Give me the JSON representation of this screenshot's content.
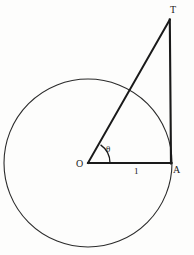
{
  "figure": {
    "kind": "geometry-diagram",
    "background_color": "#fdfdfc",
    "stroke_color": "#1a1a1a",
    "circle_stroke_color": "#2b2b2b",
    "labels": {
      "apex": "T",
      "tangent_point": "A",
      "center": "O",
      "angle": "θ",
      "radius_length": "1"
    },
    "geometry": {
      "circle": {
        "cx": 88,
        "cy": 163,
        "r": 84
      },
      "center_point": {
        "x": 88,
        "y": 163
      },
      "tangent_point": {
        "x": 171,
        "y": 163
      },
      "apex_point": {
        "x": 170,
        "y": 20
      },
      "angle_arc_radius": 22,
      "angle_degrees": 60
    }
  }
}
